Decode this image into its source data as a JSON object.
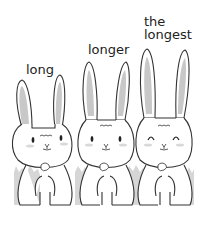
{
  "labels": {
    "rabbit1": "long",
    "rabbit2": "longer",
    "rabbit3_line1": "the",
    "rabbit3_line2": "longest"
  },
  "colors": {
    "outline": "#333333",
    "inner_ear": "#c8c8c8",
    "grass": "#d6d6d6",
    "blush": "#d9d9d9",
    "background": "#ffffff"
  },
  "rabbits": [
    {
      "id": "rabbit-1",
      "ear_length": "long",
      "eyes": "open"
    },
    {
      "id": "rabbit-2",
      "ear_length": "longer",
      "eyes": "open"
    },
    {
      "id": "rabbit-3",
      "ear_length": "longest",
      "eyes": "closed-happy"
    }
  ]
}
